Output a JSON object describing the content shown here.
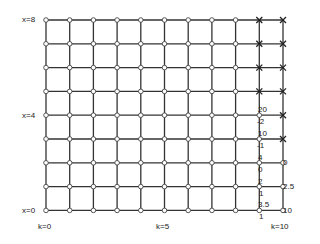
{
  "grid": {
    "cols": 10,
    "rows": 8,
    "left": 46,
    "top": 20,
    "x_spacing": 23.7,
    "y_spacing": 23.8,
    "line_color": "#333333",
    "node_fill": "#ffffff",
    "cross_nodes": [
      {
        "k": 9,
        "x": 8
      },
      {
        "k": 10,
        "x": 8
      },
      {
        "k": 9,
        "x": 7
      },
      {
        "k": 10,
        "x": 7
      },
      {
        "k": 9,
        "x": 6
      },
      {
        "k": 10,
        "x": 6
      },
      {
        "k": 9,
        "x": 5
      },
      {
        "k": 10,
        "x": 5
      },
      {
        "k": 10,
        "x": 4
      },
      {
        "k": 10,
        "x": 3
      }
    ],
    "missing_nodes": [
      {
        "k": 10,
        "x": 0.5
      }
    ]
  },
  "axis_labels": {
    "x8": "x=8",
    "x4": "x=4",
    "x0": "x=0",
    "k0": "k=0",
    "k5": "k=5",
    "k10": "k=10"
  },
  "annotations": {
    "col9": [
      "20",
      "-2",
      "10",
      "-1",
      "4",
      "0",
      "2",
      "1",
      "3.5",
      "1"
    ],
    "col10": [
      "0",
      "2.5",
      "10"
    ]
  }
}
